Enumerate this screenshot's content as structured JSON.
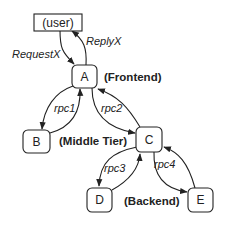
{
  "nodes": {
    "user": {
      "label": "(user)"
    },
    "a": {
      "label": "A"
    },
    "b": {
      "label": "B"
    },
    "c": {
      "label": "C"
    },
    "d": {
      "label": "D"
    },
    "e": {
      "label": "E"
    }
  },
  "tiers": {
    "frontend": "(Frontend)",
    "middle": "(Middle Tier)",
    "backend": "(Backend)"
  },
  "edges": {
    "request": "RequestX",
    "reply": "ReplyX",
    "rpc1": "rpc1",
    "rpc2": "rpc2",
    "rpc3": "rpc3",
    "rpc4": "rpc4"
  },
  "colors": {
    "stroke": "#222222",
    "background": "#ffffff"
  }
}
